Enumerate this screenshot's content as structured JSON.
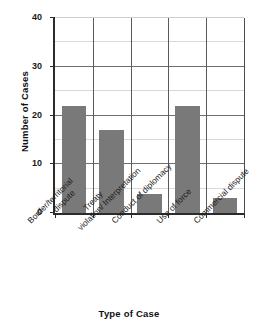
{
  "chart_data": {
    "type": "bar",
    "title": "",
    "xlabel": "Type of Case",
    "ylabel": "Number of Cases",
    "categories": [
      "Border/territorial dispute",
      "Treaty violation/ Interpretation",
      "Conduct of diplomacy",
      "Use of force",
      "Commercial dispute"
    ],
    "category_lines": [
      [
        "Border/territorial",
        "dispute"
      ],
      [
        "Treaty",
        "violation/ Interpretation"
      ],
      [
        "Conduct of diplomacy",
        ""
      ],
      [
        "Use of force",
        ""
      ],
      [
        "Commercial dispute",
        ""
      ]
    ],
    "values": [
      22,
      17,
      4,
      22,
      3
    ],
    "ylim": [
      0,
      40
    ],
    "ytick_labels": [
      "0",
      "10",
      "20",
      "30",
      "40"
    ],
    "ytick_values": [
      0,
      10,
      20,
      30,
      40
    ],
    "minor_gridline_values": [
      5,
      15,
      25,
      35
    ],
    "grid": true,
    "legend": "none",
    "bar_color": "#797979",
    "axis_color": "#2b2b2b",
    "major_gridline_color": "#6e6e6e",
    "minor_gridline_color": "#d9d9d9"
  }
}
